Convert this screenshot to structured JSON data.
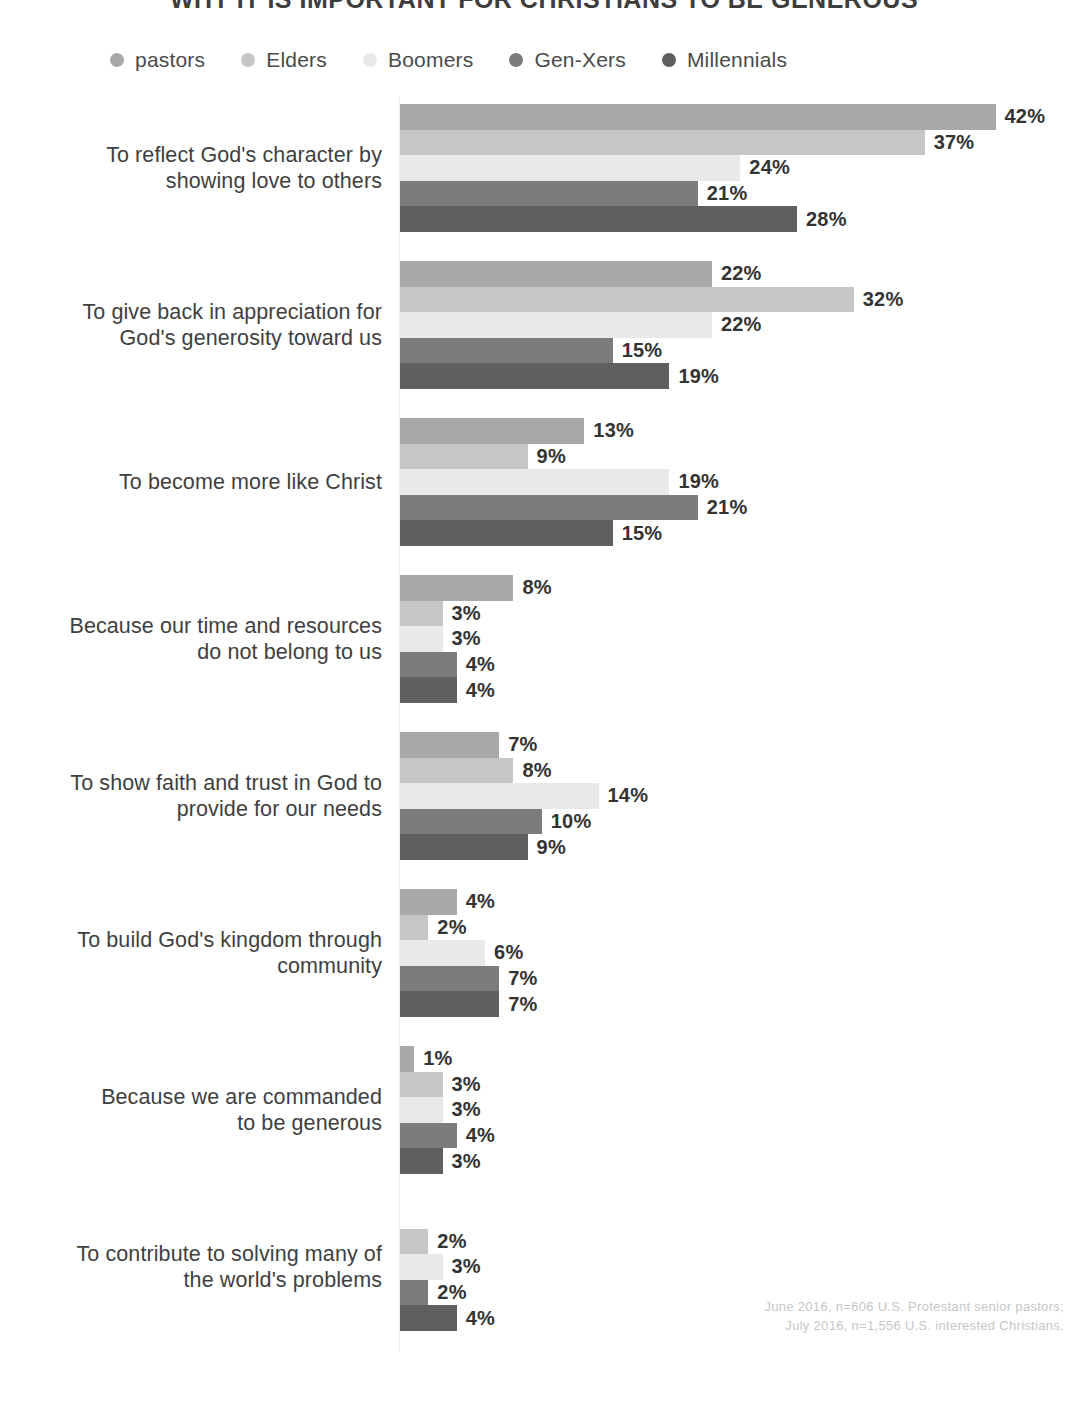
{
  "title": "WHY IT IS IMPORTANT FOR CHRISTIANS TO BE GENEROUS",
  "legend": {
    "items": [
      {
        "label": "pastors",
        "color": "#a9a9a9"
      },
      {
        "label": "Elders",
        "color": "#c6c6c6"
      },
      {
        "label": "Boomers",
        "color": "#e9e9e9"
      },
      {
        "label": "Gen-Xers",
        "color": "#7c7c7c"
      },
      {
        "label": "Millennials",
        "color": "#5f5f5f"
      }
    ]
  },
  "footnote": {
    "line1": "June 2016, n=606 U.S. Protestant senior pastors;",
    "line2": "July 2016, n=1,556 U.S. interested Christians."
  },
  "chart_data": {
    "type": "bar",
    "orientation": "horizontal",
    "title": "WHY IT IS IMPORTANT FOR CHRISTIANS TO BE GENEROUS",
    "xlabel": "",
    "ylabel": "",
    "xlim": [
      0,
      42
    ],
    "grid": false,
    "legend_position": "top",
    "value_suffix": "%",
    "categories": [
      "To reflect God's character by showing love to others",
      "To give back in appreciation for God's generosity toward us",
      "To become more like Christ",
      "Because our time and resources do not belong to us",
      "To show faith and trust in God to provide for our needs",
      "To build God's kingdom through community",
      "Because we are commanded to be generous",
      "To contribute to solving many of the world's problems"
    ],
    "series": [
      {
        "name": "pastors",
        "color": "#a9a9a9",
        "values": [
          42,
          22,
          13,
          8,
          7,
          4,
          1,
          null
        ]
      },
      {
        "name": "Elders",
        "color": "#c6c6c6",
        "values": [
          37,
          32,
          9,
          3,
          8,
          2,
          3,
          2
        ]
      },
      {
        "name": "Boomers",
        "color": "#e9e9e9",
        "values": [
          24,
          22,
          19,
          3,
          14,
          6,
          3,
          3
        ]
      },
      {
        "name": "Gen-Xers",
        "color": "#7c7c7c",
        "values": [
          21,
          15,
          21,
          4,
          10,
          7,
          4,
          2
        ]
      },
      {
        "name": "Millennials",
        "color": "#5f5f5f",
        "values": [
          28,
          19,
          15,
          4,
          9,
          7,
          3,
          4
        ]
      }
    ],
    "groups": [
      {
        "label_line1": "To reflect God's character by",
        "label_line2": "showing love to others",
        "bars": [
          {
            "series": "pastors",
            "value": 42,
            "label": "42%"
          },
          {
            "series": "Elders",
            "value": 37,
            "label": "37%"
          },
          {
            "series": "Boomers",
            "value": 24,
            "label": "24%"
          },
          {
            "series": "Gen-Xers",
            "value": 21,
            "label": "21%"
          },
          {
            "series": "Millennials",
            "value": 28,
            "label": "28%"
          }
        ]
      },
      {
        "label_line1": "To give back in appreciation for",
        "label_line2": "God's generosity toward us",
        "bars": [
          {
            "series": "pastors",
            "value": 22,
            "label": "22%"
          },
          {
            "series": "Elders",
            "value": 32,
            "label": "32%"
          },
          {
            "series": "Boomers",
            "value": 22,
            "label": "22%"
          },
          {
            "series": "Gen-Xers",
            "value": 15,
            "label": "15%"
          },
          {
            "series": "Millennials",
            "value": 19,
            "label": "19%"
          }
        ]
      },
      {
        "label_line1": "To become more like Christ",
        "label_line2": "",
        "bars": [
          {
            "series": "pastors",
            "value": 13,
            "label": "13%"
          },
          {
            "series": "Elders",
            "value": 9,
            "label": "9%"
          },
          {
            "series": "Boomers",
            "value": 19,
            "label": "19%"
          },
          {
            "series": "Gen-Xers",
            "value": 21,
            "label": "21%"
          },
          {
            "series": "Millennials",
            "value": 15,
            "label": "15%"
          }
        ]
      },
      {
        "label_line1": "Because our time and resources",
        "label_line2": "do not belong to us",
        "bars": [
          {
            "series": "pastors",
            "value": 8,
            "label": "8%"
          },
          {
            "series": "Elders",
            "value": 3,
            "label": "3%"
          },
          {
            "series": "Boomers",
            "value": 3,
            "label": "3%"
          },
          {
            "series": "Gen-Xers",
            "value": 4,
            "label": "4%"
          },
          {
            "series": "Millennials",
            "value": 4,
            "label": "4%"
          }
        ]
      },
      {
        "label_line1": "To show faith and trust in God to",
        "label_line2": "provide for our needs",
        "bars": [
          {
            "series": "pastors",
            "value": 7,
            "label": "7%"
          },
          {
            "series": "Elders",
            "value": 8,
            "label": "8%"
          },
          {
            "series": "Boomers",
            "value": 14,
            "label": "14%"
          },
          {
            "series": "Gen-Xers",
            "value": 10,
            "label": "10%"
          },
          {
            "series": "Millennials",
            "value": 9,
            "label": "9%"
          }
        ]
      },
      {
        "label_line1": "To build God's kingdom through",
        "label_line2": "community",
        "bars": [
          {
            "series": "pastors",
            "value": 4,
            "label": "4%"
          },
          {
            "series": "Elders",
            "value": 2,
            "label": "2%"
          },
          {
            "series": "Boomers",
            "value": 6,
            "label": "6%"
          },
          {
            "series": "Gen-Xers",
            "value": 7,
            "label": "7%"
          },
          {
            "series": "Millennials",
            "value": 7,
            "label": "7%"
          }
        ]
      },
      {
        "label_line1": "Because we are commanded",
        "label_line2": "to be generous",
        "bars": [
          {
            "series": "pastors",
            "value": 1,
            "label": "1%"
          },
          {
            "series": "Elders",
            "value": 3,
            "label": "3%"
          },
          {
            "series": "Boomers",
            "value": 3,
            "label": "3%"
          },
          {
            "series": "Gen-Xers",
            "value": 4,
            "label": "4%"
          },
          {
            "series": "Millennials",
            "value": 3,
            "label": "3%"
          }
        ]
      },
      {
        "label_line1": "To contribute to solving many of",
        "label_line2": "the world's problems",
        "bars": [
          {
            "series": "pastors",
            "value": 0,
            "label": ""
          },
          {
            "series": "Elders",
            "value": 2,
            "label": "2%"
          },
          {
            "series": "Boomers",
            "value": 3,
            "label": "3%"
          },
          {
            "series": "Gen-Xers",
            "value": 2,
            "label": "2%"
          },
          {
            "series": "Millennials",
            "value": 4,
            "label": "4%"
          }
        ]
      }
    ]
  }
}
